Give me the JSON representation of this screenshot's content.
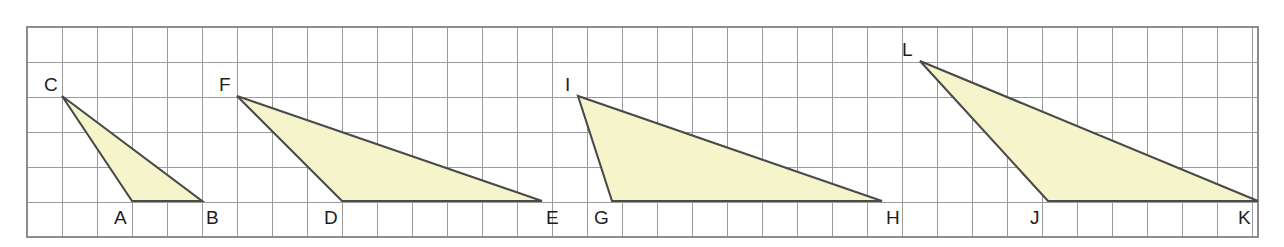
{
  "figure": {
    "width": 1284,
    "height": 247,
    "background_color": "#ffffff"
  },
  "grid": {
    "origin_x": 27,
    "origin_y": 27,
    "cell_size": 35,
    "columns": 35,
    "rows": 6,
    "line_color": "#9a9a9a",
    "border_color": "#8c8c8c",
    "right_edge": 1258,
    "bottom_edge": 237
  },
  "style": {
    "fill_color": "#F6F4CA",
    "stroke_color": "#4a4a48",
    "label_color": "#1d1d1d",
    "stroke_width": 2.1,
    "label_font_size": 19
  },
  "triangles": [
    {
      "name": "triangle-cab",
      "vertex_labels": [
        "C",
        "A",
        "B"
      ],
      "points": "62,96 132,201 202,201",
      "vertices": [
        {
          "label": "C",
          "x": 62,
          "y": 96,
          "label_x": 44,
          "label_y": 91,
          "grid_col": 1,
          "grid_row": 2
        },
        {
          "label": "A",
          "x": 132,
          "y": 201,
          "label_x": 114,
          "label_y": 224,
          "grid_col": 3,
          "grid_row": 5
        },
        {
          "label": "B",
          "x": 202,
          "y": 201,
          "label_x": 206,
          "label_y": 224,
          "grid_col": 5,
          "grid_row": 5
        }
      ],
      "base_cells": 2,
      "height_cells": 3
    },
    {
      "name": "triangle-fde",
      "vertex_labels": [
        "F",
        "D",
        "E"
      ],
      "points": "237,96 342,201 542,201",
      "vertices": [
        {
          "label": "F",
          "x": 237,
          "y": 96,
          "label_x": 219,
          "label_y": 91,
          "grid_col": 6,
          "grid_row": 2
        },
        {
          "label": "D",
          "x": 342,
          "y": 201,
          "label_x": 324,
          "label_y": 224,
          "grid_col": 9,
          "grid_row": 5
        },
        {
          "label": "E",
          "x": 542,
          "y": 201,
          "label_x": 546,
          "label_y": 224,
          "grid_col": 15,
          "grid_row": 5
        }
      ],
      "base_cells": 6,
      "height_cells": 3
    },
    {
      "name": "triangle-igh",
      "vertex_labels": [
        "I",
        "G",
        "H"
      ],
      "points": "578,96 612,201 882,201",
      "vertices": [
        {
          "label": "I",
          "x": 578,
          "y": 96,
          "label_x": 565,
          "label_y": 91,
          "grid_col": 16,
          "grid_row": 2
        },
        {
          "label": "G",
          "x": 612,
          "y": 201,
          "label_x": 594,
          "label_y": 224,
          "grid_col": 17,
          "grid_row": 5
        },
        {
          "label": "H",
          "x": 882,
          "y": 201,
          "label_x": 886,
          "label_y": 224,
          "grid_col": 25,
          "grid_row": 5
        }
      ],
      "base_cells": 8,
      "height_cells": 3
    },
    {
      "name": "triangle-ljk",
      "vertex_labels": [
        "L",
        "J",
        "K"
      ],
      "points": "920,61 1048,201 1258,201",
      "vertices": [
        {
          "label": "L",
          "x": 920,
          "y": 61,
          "label_x": 902,
          "label_y": 56,
          "grid_col": 26,
          "grid_row": 1
        },
        {
          "label": "J",
          "x": 1048,
          "y": 201,
          "label_x": 1030,
          "label_y": 224,
          "grid_col": 29,
          "grid_row": 5
        },
        {
          "label": "K",
          "x": 1258,
          "y": 201,
          "label_x": 1238,
          "label_y": 224,
          "grid_col": 35,
          "grid_row": 5
        }
      ],
      "base_cells": 6,
      "height_cells": 4
    }
  ]
}
